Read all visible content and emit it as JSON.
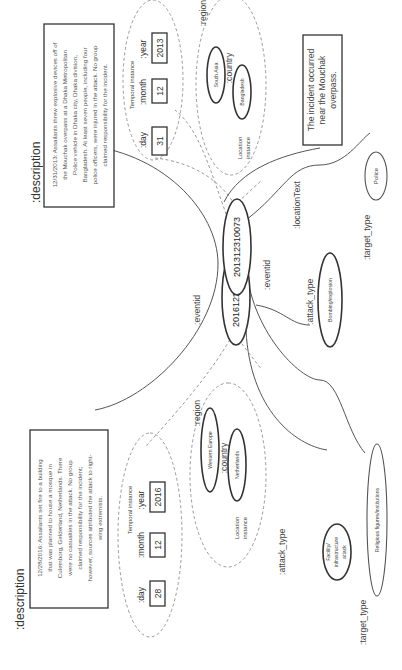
{
  "diagram": {
    "orientation": "rotated 90 degrees clockwise",
    "events": [
      {
        "eventid_label": ":eventid",
        "eventid": "201312310073",
        "description_label": ":description",
        "description_lines": [
          "12/31/2013: Assailants threw explosive devices off of",
          "the Mouchak overpass at a Dhaka Metropolitan",
          "Police vehicle in Dhaka city, Dhaka division,",
          "Bangladesh. At least seven people, including four",
          "police officers, were injured in the attack. No group",
          "claimed responsibility for the incident."
        ],
        "temporal": {
          "title": "Temporal instance",
          "day_label": ":day",
          "day": "31",
          "month_label": ":month",
          "month": "12",
          "year_label": ":year",
          "year": "2013"
        },
        "location": {
          "title_line1": "Location",
          "title_line2": "instance",
          "region_label": ":region",
          "region": "South Asia",
          "country_label": ":country",
          "country": "Bangladesh"
        },
        "location_text_label": ":locationText",
        "location_text_lines": [
          "The incident occurred",
          "near the Mouchak",
          "overpass."
        ],
        "attack_type_label": ":attack_type",
        "attack_type_lines": [
          "Bombing/explosion"
        ],
        "target_type_label": ":target_type",
        "target_type": "Police"
      },
      {
        "eventid_label": ":eventid",
        "eventid": "201612280048",
        "description_label": ":description",
        "description_lines": [
          "12/28/2016: Assailants set fire to a building",
          "that was planned to house a mosque in",
          "Culemborg, Gelderland, Netherlands. There",
          "were no casualties in the attack. No group",
          "claimed responsibility for the incident;",
          "however, sources attributed the attack to right-",
          "wing extremists."
        ],
        "temporal": {
          "title": "Temporal instance",
          "day_label": ":day",
          "day": "28",
          "month_label": ":month",
          "month": "12",
          "year_label": ":year",
          "year": "2016"
        },
        "location": {
          "title_line1": "Location",
          "title_line2": "instance",
          "region_label": ":region",
          "region": "Western Europe",
          "country_label": ":country",
          "country": "Netherlands"
        },
        "attack_type_label": ":attack_type",
        "attack_type_lines": [
          "Facility/",
          "infrastructure",
          "attack"
        ],
        "target_type_label": ":target_type",
        "target_type": "Religious figures/institutions"
      }
    ]
  }
}
